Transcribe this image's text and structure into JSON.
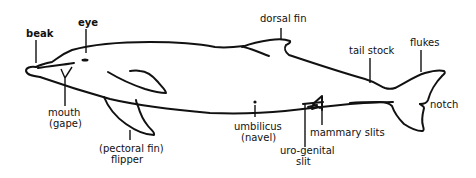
{
  "diagram": {
    "labels": {
      "beak": "beak",
      "eye": "eye",
      "mouth_line1": "mouth",
      "mouth_line2": "(gape)",
      "flipper_line1": "(pectoral fin)",
      "flipper_line2": "flipper",
      "dorsal_fin": "dorsal fin",
      "tail_stock": "tail stock",
      "flukes": "flukes",
      "notch": "notch",
      "umbilicus_line1": "umbilicus",
      "umbilicus_line2": "(navel)",
      "mammary_slits": "mammary slits",
      "urogenital_line1": "uro-genital",
      "urogenital_line2": "slit"
    },
    "colors": {
      "ink": "#111111",
      "background": "#ffffff"
    }
  }
}
